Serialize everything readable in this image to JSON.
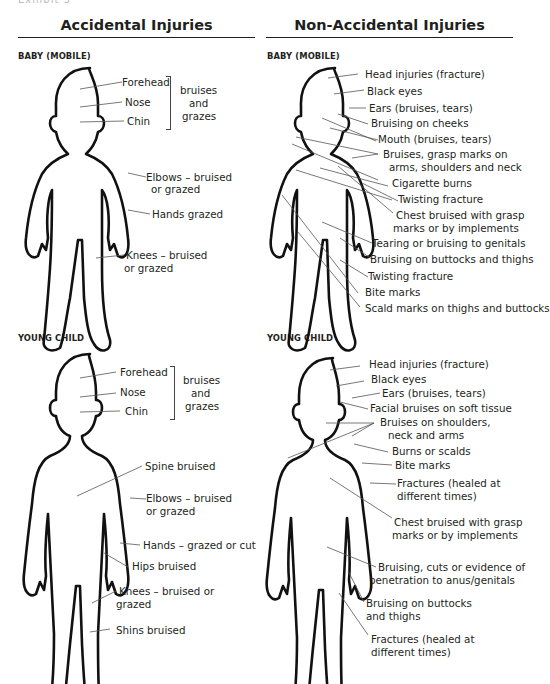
{
  "page": {
    "cut_off_header": "Exhibit 3"
  },
  "columns": {
    "accidental": {
      "title": "Accidental Injuries",
      "baby": {
        "section": "BABY (MOBILE)",
        "labels": [
          "Forehead",
          "Nose",
          "Chin"
        ],
        "group_label": [
          "bruises",
          "and",
          "grazes"
        ],
        "others": [
          "Elbows – bruised",
          "or grazed",
          "Hands grazed",
          "Knees – bruised",
          "or grazed"
        ]
      },
      "child": {
        "section": "YOUNG CHILD",
        "labels": [
          "Forehead",
          "Nose",
          "Chin"
        ],
        "group_label": [
          "bruises",
          "and",
          "grazes"
        ],
        "others": [
          "Spine bruised",
          "Elbows – bruised",
          "or grazed",
          "Hands – grazed or cut",
          "Hips bruised",
          "Knees – bruised or",
          "grazed",
          "Shins bruised"
        ]
      }
    },
    "non_accidental": {
      "title": "Non-Accidental Injuries",
      "baby": {
        "section": "BABY (MOBILE)",
        "labels": [
          "Head injuries (fracture)",
          "Black eyes",
          "Ears (bruises, tears)",
          "Bruising on cheeks",
          "Mouth (bruises, tears)",
          "Bruises, grasp marks on",
          "arms, shoulders and neck",
          "Cigarette burns",
          "Twisting fracture",
          "Chest bruised with grasp",
          "marks or by implements",
          "Tearing or bruising to genitals",
          "Bruising on buttocks and thighs",
          "Twisting fracture",
          "Bite marks",
          "Scald marks on thighs and buttocks"
        ]
      },
      "child": {
        "section": "YOUNG CHILD",
        "labels": [
          "Head injuries (fracture)",
          "Black eyes",
          "Ears (bruises, tears)",
          "Facial bruises on soft tissue",
          "Bruises on shoulders,",
          "neck and arms",
          "Burns or scalds",
          "Bite marks",
          "Fractures (healed at",
          "different times)",
          "Chest bruised with grasp",
          "marks or by implements",
          "Bruising, cuts or evidence of",
          "penetration to anus/genitals",
          "Bruising on buttocks",
          "and thighs",
          "Fractures (healed at",
          "different times)"
        ]
      }
    }
  }
}
